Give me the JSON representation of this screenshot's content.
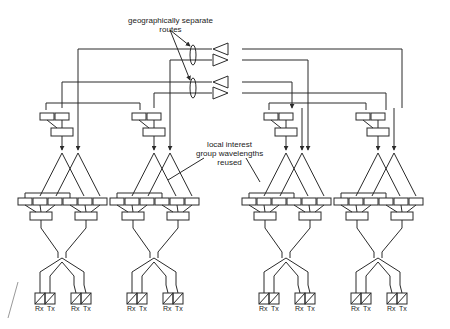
{
  "annotations": {
    "routes_line1": "geographically separate",
    "routes_line2": "routes",
    "local_line1": "local interest",
    "local_line2": "group wavelengths",
    "local_line3": "reused"
  },
  "terminals": {
    "rx": "Rx",
    "tx": "Tx"
  },
  "colors": {
    "line": "#2a2a2a",
    "background": "#ffffff"
  }
}
